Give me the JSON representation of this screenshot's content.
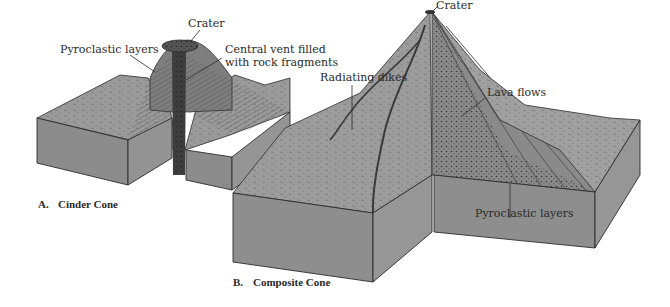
{
  "figure": {
    "panels": [
      {
        "id": "A",
        "caption_letter": "A.",
        "caption_title": "Cinder Cone",
        "labels": {
          "crater": "Crater",
          "pyroclastic": "Pyroclastic layers",
          "vent_line1": "Central vent filled",
          "vent_line2": "with rock fragments"
        }
      },
      {
        "id": "B",
        "caption_letter": "B.",
        "caption_title": "Composite Cone",
        "labels": {
          "crater": "Crater",
          "dikes": "Radiating dikes",
          "lava": "Lava flows",
          "pyroclastic": "Pyroclastic layers"
        }
      }
    ],
    "colors": {
      "side_face": "#8a8a8a",
      "top_face": "#9c9c9c",
      "cone": "#7d7d7d",
      "vent": "#3c3c3c",
      "outline": "#2b2b2b",
      "background": "#ffffff"
    }
  }
}
